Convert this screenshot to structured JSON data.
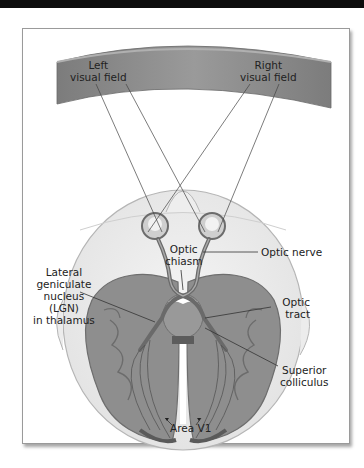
{
  "diagram": {
    "labels": {
      "left_visual_field": [
        "Left",
        "visual field"
      ],
      "right_visual_field": [
        "Right",
        "visual field"
      ],
      "optic_chiasm": [
        "Optic",
        "chiasm"
      ],
      "optic_nerve": "Optic nerve",
      "lgn": [
        "Lateral",
        "geniculate",
        "nucleus",
        "(LGN)",
        "in thalamus"
      ],
      "optic_tract": [
        "Optic",
        "tract"
      ],
      "superior_colliculus": [
        "Superior",
        "colliculus"
      ],
      "area_v1": "Area V1"
    },
    "colors": {
      "visual_field_band": "#8a8a8a",
      "brain_tissue": "#8c8c8c",
      "brain_dark": "#6e6e6e",
      "head_outline": "#b8b8b8",
      "leader_line": "#333333",
      "frame_border": "#9a9a9a"
    }
  }
}
